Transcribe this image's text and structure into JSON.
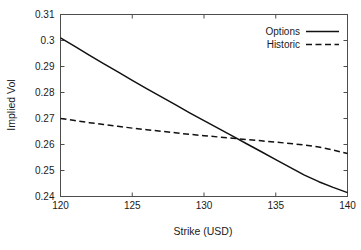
{
  "chart_data": {
    "type": "line",
    "title": "",
    "xlabel": "Strike (USD)",
    "ylabel": "Implied Vol",
    "xlim": [
      120,
      140
    ],
    "ylim": [
      0.24,
      0.31
    ],
    "xticks": [
      120,
      125,
      130,
      135,
      140
    ],
    "xtick_labels": [
      "120",
      "125",
      "130",
      "135",
      "140"
    ],
    "yticks": [
      0.24,
      0.25,
      0.26,
      0.27,
      0.28,
      0.29,
      0.3,
      0.31
    ],
    "ytick_labels": [
      "0.24",
      "0.25",
      "0.26",
      "0.27",
      "0.28",
      "0.29",
      "0.3",
      "0.31"
    ],
    "grid": false,
    "legend_position": "top-right-inside",
    "frame": "box",
    "x": [
      120,
      121,
      122,
      123,
      124,
      125,
      126,
      127,
      128,
      129,
      130,
      131,
      132,
      133,
      134,
      135,
      136,
      137,
      138,
      139,
      140
    ],
    "series": [
      {
        "name": "Options",
        "style": "solid",
        "color": "#111111",
        "values": [
          0.301,
          0.2977,
          0.2944,
          0.2911,
          0.2879,
          0.2847,
          0.2815,
          0.2784,
          0.2753,
          0.2722,
          0.2692,
          0.2662,
          0.2632,
          0.2602,
          0.2572,
          0.2542,
          0.2512,
          0.2482,
          0.2457,
          0.2435,
          0.2415
        ]
      },
      {
        "name": "Historic",
        "style": "dashed",
        "color": "#111111",
        "values": [
          0.27,
          0.2692,
          0.2684,
          0.2677,
          0.267,
          0.2663,
          0.2657,
          0.2651,
          0.2645,
          0.2639,
          0.2634,
          0.2629,
          0.2624,
          0.2619,
          0.2614,
          0.2609,
          0.2604,
          0.2598,
          0.259,
          0.2579,
          0.2565
        ]
      }
    ],
    "legend": [
      {
        "label": "Options",
        "style": "solid"
      },
      {
        "label": "Historic",
        "style": "dashed"
      }
    ]
  }
}
